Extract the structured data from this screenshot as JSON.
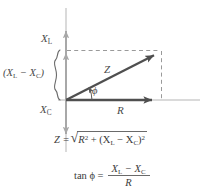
{
  "figure": {
    "background_color": "#ffffff"
  },
  "colors": {
    "axis": "#a8a8a8",
    "vector": "#4f4f4f",
    "dashed": "#9a9a9a",
    "text": "#4a4a4a",
    "brace": "#6a6a6a"
  },
  "labels": {
    "x_l": "X",
    "x_l_sub": "L",
    "x_c": "X",
    "x_c_sub": "C",
    "difference_open": "(X",
    "difference_sub1": "L",
    "difference_minus": " − X",
    "difference_sub2": "C",
    "difference_close": ")",
    "impedance": "Z",
    "resistance": "R",
    "phase_angle": "ϕ"
  },
  "equations": {
    "impedance": {
      "lhs": "Z =",
      "radical_sign": "√",
      "term1": "R",
      "term1_exp": "2",
      "operator": " + (X",
      "sub1": "L",
      "minus": " − X",
      "sub2": "C",
      "close": ")",
      "term2_exp": "2"
    },
    "tangent": {
      "lhs": "tan ϕ =",
      "numerator": "X",
      "numerator_sub1": "L",
      "numerator_minus": " − X",
      "numerator_sub2": "C",
      "denominator": "R"
    }
  },
  "geometry": {
    "origin": {
      "x": 66,
      "y": 100
    },
    "z_tip": {
      "x": 161,
      "y": 51
    },
    "r_arrow_end": {
      "x": 160,
      "y": 100
    },
    "vertical_axis": {
      "x": 66,
      "top": 8,
      "bottom": 152
    },
    "horizontal_axis": {
      "y": 100,
      "left": 58,
      "right": 200
    },
    "xl_arrow": {
      "from_y": 96,
      "to_y": 30
    },
    "xc_arrow": {
      "from_y": 100,
      "to_y": 135
    },
    "brace": {
      "x": 57,
      "top": 50,
      "bottom": 100
    },
    "phi_arc_radius": 26
  }
}
